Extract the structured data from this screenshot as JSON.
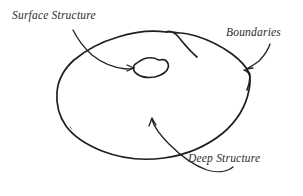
{
  "figure": {
    "type": "hand-drawn-diagram",
    "background_color": "#ffffff",
    "ink_color": "#1f1f1f",
    "width": 303,
    "height": 196
  },
  "labels": {
    "surface_structure": "Surface Structure",
    "boundaries": "Boundaries",
    "deep_structure": "Deep Structure"
  },
  "shapes": {
    "outer_blob": {
      "name": "outer-blob",
      "description": "large irregular hand-drawn closed curve with a notch at the top and a point at the right"
    },
    "inner_blob": {
      "name": "inner-blob",
      "description": "small irregular closed curve inside the upper middle of the outer blob"
    }
  },
  "annotations": [
    {
      "name": "surface-structure-annotation",
      "label": "Surface Structure",
      "points_to": "inner-blob",
      "arrow_start": [
        73,
        30
      ],
      "arrow_end": [
        133,
        68
      ]
    },
    {
      "name": "boundaries-annotation",
      "label": "Boundaries",
      "points_to": "outer-blob-edge",
      "arrow_start": [
        270,
        44
      ],
      "arrow_end": [
        247,
        68
      ]
    },
    {
      "name": "deep-structure-annotation",
      "label": "Deep Structure",
      "points_to": "outer-blob-interior",
      "arrow_start": [
        233,
        167
      ],
      "arrow_end": [
        152,
        119
      ]
    }
  ]
}
